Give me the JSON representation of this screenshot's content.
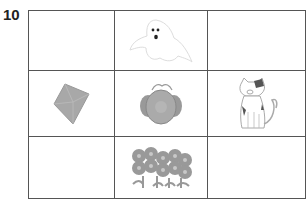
{
  "question_number": "10",
  "grid": {
    "rows": 3,
    "cols": 3,
    "cells": [
      {
        "row": 1,
        "col": 1,
        "content": "empty"
      },
      {
        "row": 1,
        "col": 2,
        "content": "ghost-icon"
      },
      {
        "row": 1,
        "col": 3,
        "content": "empty"
      },
      {
        "row": 2,
        "col": 1,
        "content": "diamond-icon"
      },
      {
        "row": 2,
        "col": 2,
        "content": "flower-pot-icon"
      },
      {
        "row": 2,
        "col": 3,
        "content": "cat-icon"
      },
      {
        "row": 3,
        "col": 1,
        "content": "empty"
      },
      {
        "row": 3,
        "col": 2,
        "content": "flowers-icon"
      },
      {
        "row": 3,
        "col": 3,
        "content": "empty"
      }
    ]
  },
  "colors": {
    "grid_line": "#555555",
    "image_fill": "#a8a8a8"
  }
}
